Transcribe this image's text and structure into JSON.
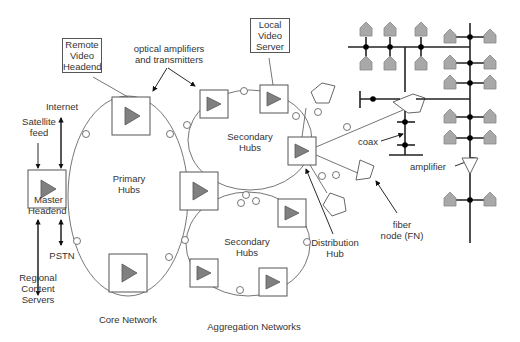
{
  "diagram": {
    "labels": {
      "remote_video_headend": [
        "Remote",
        "Video",
        "Headend"
      ],
      "optical_amplifiers": [
        "optical amplifiers",
        "and transmitters"
      ],
      "local_video_server": [
        "Local",
        "Video",
        "Server"
      ],
      "internet": "Internet",
      "satellite_feed": [
        "Satellite",
        "feed"
      ],
      "master_headend": [
        "Master",
        "Headend"
      ],
      "primary_hubs": [
        "Primary",
        "Hubs"
      ],
      "secondary_hubs_top": [
        "Secondary",
        "Hubs"
      ],
      "secondary_hubs_bottom": [
        "Secondary",
        "Hubs"
      ],
      "pstn": "PSTN",
      "regional_content_servers": [
        "Regional",
        "Content",
        "Servers"
      ],
      "distribution_hub": [
        "Distribution",
        "Hub"
      ],
      "fiber_node": [
        "fiber",
        "node (FN)"
      ],
      "coax": "coax",
      "amplifier": "amplifier",
      "core_network": "Core Network",
      "aggregation_networks": "Aggregation Networks"
    },
    "colors": {
      "line": "#555555",
      "triangle_fill": "#808080",
      "house_fill": "#a8a8a8",
      "tap_dot": "#000000"
    }
  }
}
